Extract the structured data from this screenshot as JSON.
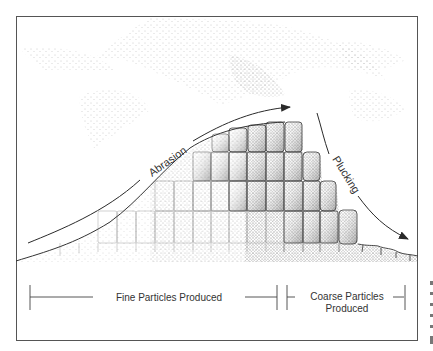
{
  "figure": {
    "type": "glacial-erosion-diagram",
    "labels": {
      "abrasion": "Abrasion",
      "plucking": "Plucking",
      "fine_particles": "Fine Particles Produced",
      "coarse_particles_line1": "Coarse Particles",
      "coarse_particles_line2": "Produced"
    },
    "colors": {
      "frame": "#555555",
      "ink": "#2a2a2a",
      "stipple": "#6a6a6a",
      "background": "#ffffff"
    },
    "arrows": [
      {
        "name": "abrasion-arrow",
        "direction": "up-right along bedrock slope"
      },
      {
        "name": "plucking-arrow",
        "direction": "down-right along lee face"
      }
    ],
    "extents": [
      {
        "name": "fine-particles-extent",
        "from_x": 30,
        "to_x": 278
      },
      {
        "name": "coarse-particles-extent",
        "from_x": 287,
        "to_x": 405
      }
    ]
  }
}
